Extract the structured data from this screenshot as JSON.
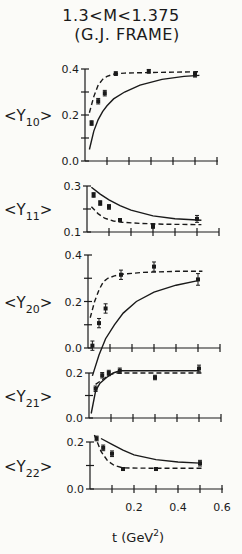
{
  "title": {
    "line1": "1.3<M<1.375",
    "line2": "(G.J. FRAME)"
  },
  "xaxis": {
    "label": "t (GeV",
    "label_sup": "2",
    "label_close": ")",
    "ticks": [
      0.2,
      0.4,
      0.6
    ],
    "tick_labels": [
      "0.2",
      "0.4",
      "0.6"
    ],
    "range": [
      0,
      0.6
    ]
  },
  "chart_data": [
    {
      "type": "scatter",
      "title": "1.3<M<1.375 (G.J. FRAME)",
      "ylabel": "<Y10>",
      "ylabel_main": "Y",
      "ylabel_sub": "10",
      "xlabel": "t (GeV^2)",
      "xlim": [
        0,
        0.6
      ],
      "ylim": [
        0.0,
        0.4
      ],
      "yticks": [
        0.0,
        0.2,
        0.4
      ],
      "ytick_labels": [
        "0.0",
        "0.2",
        "0.4"
      ],
      "points": {
        "x": [
          0.03,
          0.06,
          0.09,
          0.14,
          0.29,
          0.5
        ],
        "y": [
          0.165,
          0.26,
          0.295,
          0.38,
          0.39,
          0.375
        ],
        "err": [
          0.01,
          0.012,
          0.012,
          0.008,
          0.008,
          0.01
        ]
      },
      "series": [
        {
          "name": "dashed-curve",
          "style": "dashed",
          "x": [
            0.02,
            0.04,
            0.06,
            0.08,
            0.1,
            0.13,
            0.18,
            0.3,
            0.5,
            0.52
          ],
          "y": [
            0.21,
            0.28,
            0.33,
            0.355,
            0.368,
            0.378,
            0.382,
            0.385,
            0.388,
            0.388
          ]
        },
        {
          "name": "solid-curve",
          "style": "solid",
          "x": [
            0.02,
            0.04,
            0.06,
            0.08,
            0.1,
            0.13,
            0.18,
            0.25,
            0.35,
            0.45,
            0.52
          ],
          "y": [
            0.05,
            0.13,
            0.18,
            0.215,
            0.24,
            0.27,
            0.3,
            0.33,
            0.355,
            0.368,
            0.372
          ]
        }
      ],
      "grid": false
    },
    {
      "type": "scatter",
      "ylabel": "<Y11>",
      "ylabel_main": "Y",
      "ylabel_sub": "11",
      "xlim": [
        0,
        0.6
      ],
      "ylim": [
        0.1,
        0.3
      ],
      "yticks": [
        0.1,
        0.3
      ],
      "ytick_labels": [
        "0.1",
        "0.3"
      ],
      "points": {
        "x": [
          0.03,
          0.06,
          0.1,
          0.15,
          0.3,
          0.5
        ],
        "y": [
          0.261,
          0.226,
          0.209,
          0.152,
          0.126,
          0.157
        ],
        "err": [
          0.01,
          0.01,
          0.01,
          0.006,
          0.01,
          0.015
        ]
      },
      "series": [
        {
          "name": "solid-curve",
          "style": "solid",
          "x": [
            0.02,
            0.06,
            0.1,
            0.15,
            0.2,
            0.3,
            0.4,
            0.5,
            0.52
          ],
          "y": [
            0.295,
            0.265,
            0.24,
            0.215,
            0.195,
            0.17,
            0.158,
            0.152,
            0.151
          ]
        },
        {
          "name": "dashed-curve",
          "style": "dashed",
          "x": [
            0.02,
            0.05,
            0.08,
            0.12,
            0.16,
            0.25,
            0.35,
            0.5,
            0.52
          ],
          "y": [
            0.21,
            0.18,
            0.16,
            0.148,
            0.142,
            0.137,
            0.134,
            0.132,
            0.132
          ]
        }
      ],
      "grid": false
    },
    {
      "type": "scatter",
      "ylabel": "<Y20>",
      "ylabel_main": "Y",
      "ylabel_sub": "20",
      "xlim": [
        0,
        0.6
      ],
      "ylim": [
        0.0,
        0.4
      ],
      "yticks": [
        0.0,
        0.2,
        0.4
      ],
      "ytick_labels": [
        "0.0",
        "0.2",
        "0.4"
      ],
      "points": {
        "x": [
          0.02,
          0.05,
          0.08,
          0.15,
          0.3,
          0.5
        ],
        "y": [
          0.01,
          0.107,
          0.17,
          0.315,
          0.35,
          0.295
        ],
        "err": [
          0.02,
          0.02,
          0.02,
          0.02,
          0.02,
          0.025
        ]
      },
      "series": [
        {
          "name": "dashed-curve",
          "style": "dashed",
          "x": [
            0.01,
            0.03,
            0.05,
            0.07,
            0.09,
            0.12,
            0.16,
            0.25,
            0.4,
            0.52
          ],
          "y": [
            0.13,
            0.2,
            0.25,
            0.285,
            0.3,
            0.31,
            0.318,
            0.325,
            0.33,
            0.33
          ]
        },
        {
          "name": "solid-curve",
          "style": "solid",
          "x": [
            0.02,
            0.05,
            0.08,
            0.12,
            0.16,
            0.22,
            0.3,
            0.4,
            0.5
          ],
          "y": [
            -0.12,
            -0.03,
            0.04,
            0.1,
            0.15,
            0.2,
            0.24,
            0.27,
            0.29
          ]
        }
      ],
      "grid": false
    },
    {
      "type": "scatter",
      "ylabel": "<Y21>",
      "ylabel_main": "Y",
      "ylabel_sub": "21",
      "xlim": [
        0,
        0.6
      ],
      "ylim": [
        0.0,
        0.2
      ],
      "yticks": [
        0.0,
        0.2
      ],
      "ytick_labels": [
        "0.0",
        "0.2"
      ],
      "points": {
        "x": [
          0.03,
          0.06,
          0.09,
          0.14,
          0.3,
          0.5
        ],
        "y": [
          0.13,
          0.19,
          0.2,
          0.21,
          0.18,
          0.22
        ],
        "err": [
          0.012,
          0.012,
          0.012,
          0.012,
          0.01,
          0.015
        ]
      },
      "series": [
        {
          "name": "solid-curve",
          "style": "solid",
          "x": [
            0.01,
            0.03,
            0.05,
            0.08,
            0.11,
            0.14,
            0.3,
            0.5
          ],
          "y": [
            0.02,
            0.12,
            0.155,
            0.18,
            0.2,
            0.21,
            0.21,
            0.21
          ]
        },
        {
          "name": "dashed-curve",
          "style": "dashed",
          "x": [
            0.03,
            0.06,
            0.09,
            0.12,
            0.15,
            0.3,
            0.5,
            0.52
          ],
          "y": [
            0.15,
            0.17,
            0.19,
            0.2,
            0.2,
            0.2,
            0.2,
            0.2
          ]
        }
      ],
      "grid": false
    },
    {
      "type": "scatter",
      "ylabel": "<Y22>",
      "ylabel_main": "Y",
      "ylabel_sub": "22",
      "xlabel": "t (GeV^2)",
      "xlim": [
        0,
        0.6
      ],
      "ylim": [
        0.0,
        0.2
      ],
      "xticks": [
        0.2,
        0.4,
        0.6
      ],
      "xtick_labels": [
        "0.2",
        "0.4",
        "0.6"
      ],
      "yticks": [
        0.0,
        0.2
      ],
      "ytick_labels": [
        "0.0",
        "0.2"
      ],
      "points": {
        "x": [
          0.03,
          0.06,
          0.1,
          0.15,
          0.3,
          0.5
        ],
        "y": [
          0.215,
          0.175,
          0.15,
          0.085,
          0.085,
          0.11
        ],
        "err": [
          0.01,
          0.012,
          0.012,
          0.006,
          0.006,
          0.012
        ]
      },
      "series": [
        {
          "name": "solid-curve",
          "style": "solid",
          "x": [
            0.05,
            0.1,
            0.15,
            0.2,
            0.3,
            0.4,
            0.5
          ],
          "y": [
            0.215,
            0.19,
            0.165,
            0.145,
            0.125,
            0.115,
            0.11
          ]
        },
        {
          "name": "dashed-curve",
          "style": "dashed",
          "x": [
            0.02,
            0.05,
            0.08,
            0.11,
            0.15,
            0.3,
            0.5,
            0.52
          ],
          "y": [
            0.23,
            0.16,
            0.12,
            0.1,
            0.09,
            0.088,
            0.088,
            0.088
          ]
        }
      ],
      "grid": false
    }
  ]
}
